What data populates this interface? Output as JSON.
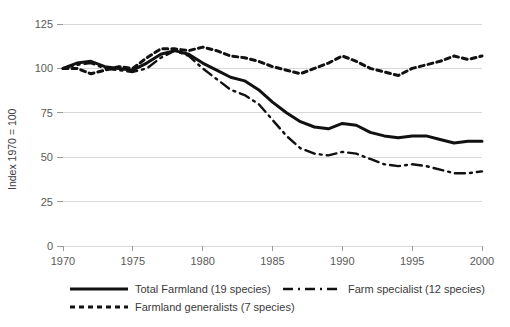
{
  "chart_data": {
    "type": "line",
    "title": "",
    "xlabel": "",
    "ylabel": "Index 1970 = 100",
    "xlim": [
      1970,
      2000
    ],
    "ylim": [
      0,
      125
    ],
    "grid": true,
    "legend_position": "bottom",
    "x_ticks": [
      "1970",
      "1975",
      "1980",
      "1985",
      "1990",
      "1995",
      "2000"
    ],
    "y_ticks": [
      "0",
      "25",
      "50",
      "75",
      "100",
      "125"
    ],
    "x": [
      1970,
      1971,
      1972,
      1973,
      1974,
      1975,
      1976,
      1977,
      1978,
      1979,
      1980,
      1981,
      1982,
      1983,
      1984,
      1985,
      1986,
      1987,
      1988,
      1989,
      1990,
      1991,
      1992,
      1993,
      1994,
      1995,
      1996,
      1997,
      1998,
      1999,
      2000
    ],
    "series": [
      {
        "name": "Total Farmland (19 species)",
        "style": "solid",
        "color": "#111111",
        "values": [
          100,
          103,
          104,
          101,
          100,
          99,
          103,
          108,
          110,
          108,
          103,
          99,
          95,
          93,
          88,
          81,
          75,
          70,
          67,
          66,
          69,
          68,
          64,
          62,
          61,
          62,
          62,
          60,
          58,
          59,
          59
        ]
      },
      {
        "name": "Farm specialist (12 species)",
        "style": "dashed",
        "color": "#111111",
        "values": [
          100,
          102,
          103,
          100,
          99,
          98,
          100,
          106,
          110,
          107,
          100,
          94,
          88,
          85,
          80,
          71,
          62,
          55,
          52,
          51,
          53,
          52,
          49,
          46,
          45,
          46,
          45,
          43,
          41,
          41,
          42
        ]
      },
      {
        "name": "Farmland generalists (7 species)",
        "style": "dotted",
        "color": "#111111",
        "values": [
          100,
          100,
          97,
          99,
          101,
          100,
          106,
          111,
          111,
          110,
          112,
          110,
          107,
          106,
          104,
          101,
          99,
          97,
          100,
          103,
          107,
          104,
          100,
          98,
          96,
          100,
          102,
          104,
          107,
          105,
          107
        ]
      }
    ]
  },
  "legend": {
    "items": [
      {
        "label": "Total Farmland (19 species)",
        "style": "solid"
      },
      {
        "label": "Farm specialist (12 species)",
        "style": "dashed"
      },
      {
        "label": "Farmland generalists (7 species)",
        "style": "dotted"
      }
    ]
  }
}
